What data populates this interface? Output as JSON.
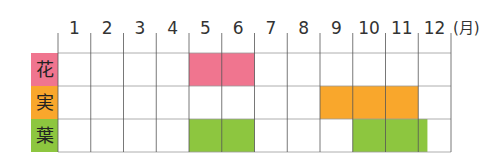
{
  "chart_data": {
    "type": "table",
    "title": "",
    "unit_label": "(月)",
    "months": [
      "1",
      "2",
      "3",
      "4",
      "5",
      "6",
      "7",
      "8",
      "9",
      "10",
      "11",
      "12"
    ],
    "rows": [
      {
        "label": "花",
        "color": "#f0758f",
        "periods": [
          {
            "start": 5,
            "end": 7
          }
        ]
      },
      {
        "label": "実",
        "color": "#f9a72c",
        "periods": [
          {
            "start": 9,
            "end": 12
          }
        ]
      },
      {
        "label": "葉",
        "color": "#8dc63f",
        "periods": [
          {
            "start": 5,
            "end": 7
          },
          {
            "start": 10,
            "end": 12.28
          }
        ]
      }
    ],
    "grid_color": "#9a9a9a",
    "divider_color": "#555555"
  }
}
